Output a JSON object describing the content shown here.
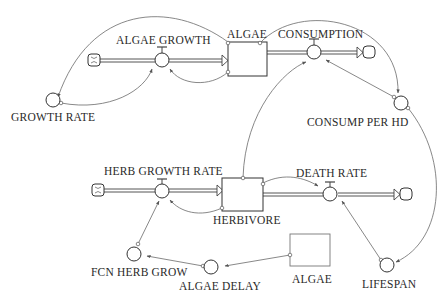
{
  "diagram": {
    "type": "stock-and-flow",
    "stocks": [
      {
        "id": "algae",
        "label": "ALGAE"
      },
      {
        "id": "herbivore",
        "label": "HERBIVORE"
      },
      {
        "id": "algae_ghost",
        "label": "ALGAE"
      }
    ],
    "flows": [
      {
        "id": "algae_growth",
        "label": "ALGAE GROWTH"
      },
      {
        "id": "consumption",
        "label": "CONSUMPTION"
      },
      {
        "id": "herb_growth_rate",
        "label": "HERB GROWTH RATE"
      },
      {
        "id": "death_rate",
        "label": "DEATH RATE"
      }
    ],
    "auxiliaries": [
      {
        "id": "growth_rate",
        "label": "GROWTH RATE"
      },
      {
        "id": "consump_per_hd",
        "label": "CONSUMP PER HD"
      },
      {
        "id": "fcn_herb_grow",
        "label": "FCN HERB GROW"
      },
      {
        "id": "algae_delay",
        "label": "ALGAE DELAY"
      },
      {
        "id": "lifespan",
        "label": "LIFESPAN"
      }
    ],
    "links": [
      [
        "algae",
        "algae_growth"
      ],
      [
        "algae",
        "growth_rate"
      ],
      [
        "growth_rate",
        "algae_growth"
      ],
      [
        "algae",
        "consump_per_hd"
      ],
      [
        "herbivore",
        "consumption"
      ],
      [
        "consump_per_hd",
        "consumption"
      ],
      [
        "consump_per_hd",
        "lifespan"
      ],
      [
        "herbivore",
        "herb_growth_rate"
      ],
      [
        "herbivore",
        "death_rate"
      ],
      [
        "lifespan",
        "death_rate"
      ],
      [
        "fcn_herb_grow",
        "herb_growth_rate"
      ],
      [
        "algae_delay",
        "fcn_herb_grow"
      ],
      [
        "algae_ghost",
        "algae_delay"
      ]
    ]
  }
}
